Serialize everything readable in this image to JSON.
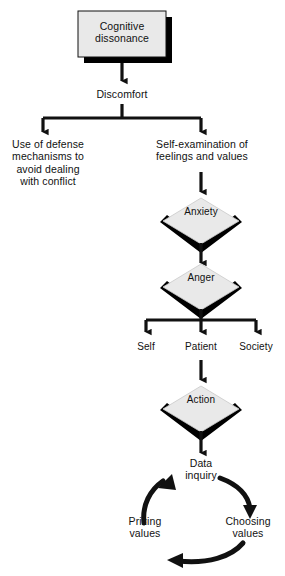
{
  "diagram": {
    "colors": {
      "shape_fill": "#e9e9e9",
      "shadow": "#000000",
      "stroke": "#111111",
      "background": "#ffffff",
      "text": "#111111"
    },
    "nodes": {
      "cognitive_dissonance": {
        "label": "Cognitive\ndissonance",
        "shape": "rectangle"
      },
      "discomfort": {
        "label": "Discomfort",
        "shape": "text"
      },
      "defense_mechanisms": {
        "label": "Use of defense\nmechanisms to\navoid dealing\nwith conflict",
        "shape": "text"
      },
      "self_examination": {
        "label": "Self-examination of\nfeelings and values",
        "shape": "text"
      },
      "anxiety": {
        "label": "Anxiety",
        "shape": "diamond"
      },
      "anger": {
        "label": "Anger",
        "shape": "diamond"
      },
      "self": {
        "label": "Self",
        "shape": "text"
      },
      "patient": {
        "label": "Patient",
        "shape": "text"
      },
      "society": {
        "label": "Society",
        "shape": "text"
      },
      "action": {
        "label": "Action",
        "shape": "diamond"
      },
      "data_inquiry": {
        "label": "Data\ninquiry",
        "shape": "text"
      },
      "choosing_values": {
        "label": "Choosing\nvalues",
        "shape": "text"
      },
      "prizing_values": {
        "label": "Prizing\nvalues",
        "shape": "text"
      }
    },
    "edges": [
      {
        "from": "cognitive_dissonance",
        "to": "discomfort",
        "kind": "arrow-down"
      },
      {
        "from": "discomfort",
        "to": "defense_mechanisms",
        "kind": "branch-left"
      },
      {
        "from": "discomfort",
        "to": "self_examination",
        "kind": "branch-right"
      },
      {
        "from": "self_examination",
        "to": "anxiety",
        "kind": "arrow-down"
      },
      {
        "from": "anxiety",
        "to": "anger",
        "kind": "arrow-down"
      },
      {
        "from": "anger",
        "to": "self",
        "kind": "branch-left"
      },
      {
        "from": "anger",
        "to": "patient",
        "kind": "branch-center"
      },
      {
        "from": "anger",
        "to": "society",
        "kind": "branch-right"
      },
      {
        "from": "patient",
        "to": "action",
        "kind": "arrow-down"
      },
      {
        "from": "action",
        "to": "data_inquiry",
        "kind": "arrow-down"
      },
      {
        "from": "data_inquiry",
        "to": "choosing_values",
        "kind": "arc-clockwise"
      },
      {
        "from": "choosing_values",
        "to": "prizing_values",
        "kind": "arc-clockwise"
      },
      {
        "from": "prizing_values",
        "to": "data_inquiry",
        "kind": "arc-clockwise"
      }
    ]
  }
}
